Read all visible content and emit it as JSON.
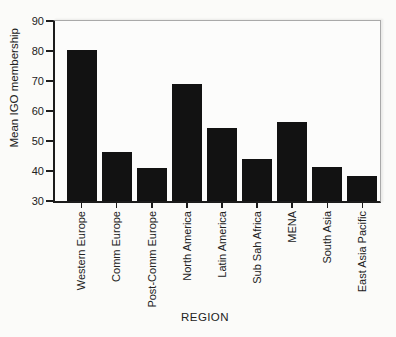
{
  "chart_data": {
    "type": "bar",
    "xlabel": "REGION",
    "ylabel": "Mean IGO membership",
    "categories": [
      "Western Europe",
      "Comm Europe",
      "Post-Comm Europe",
      "North America",
      "Latin America",
      "Sub Sah Africa",
      "MENA",
      "South Asia",
      "East Asia Pacific"
    ],
    "values": [
      80.5,
      46.5,
      41,
      69,
      54.5,
      44,
      56.5,
      41.5,
      38.5
    ],
    "ylim": [
      30,
      90
    ],
    "yticks": [
      30,
      40,
      50,
      60,
      70,
      80,
      90
    ],
    "grid": false,
    "legend_position": "none",
    "bar_color": "#121212",
    "axis_color": "#1c1c1c",
    "frame_color": "#a9a9a9",
    "background_color": "#fbfbf9"
  }
}
